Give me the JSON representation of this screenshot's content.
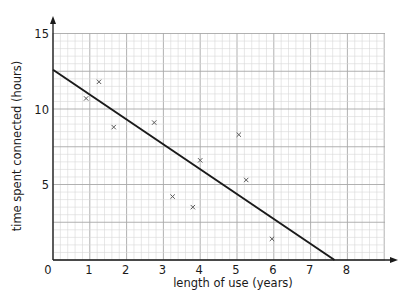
{
  "chart_data": {
    "type": "scatter",
    "title": "",
    "xlabel": "length of use (years)",
    "ylabel": "time spent connected (hours)",
    "xlim": [
      0,
      9
    ],
    "ylim": [
      0,
      15
    ],
    "x_ticks": [
      0,
      1,
      2,
      3,
      4,
      5,
      6,
      7,
      8
    ],
    "y_ticks": [
      5,
      10,
      15
    ],
    "x_tick_labels": [
      "0",
      "1",
      "2",
      "3",
      "4",
      "5",
      "6",
      "7",
      "8"
    ],
    "y_tick_labels": [
      "5",
      "10",
      "15"
    ],
    "grid": true,
    "grid_minor_step": {
      "x": 0.2,
      "y": 0.5
    },
    "grid_major_step": {
      "x": 1,
      "y": 2.5
    },
    "marker": "x",
    "series": [
      {
        "name": "data points",
        "points": [
          {
            "x": 0.9,
            "y": 10.7
          },
          {
            "x": 1.25,
            "y": 11.8
          },
          {
            "x": 1.65,
            "y": 8.8
          },
          {
            "x": 2.75,
            "y": 9.1
          },
          {
            "x": 3.25,
            "y": 4.2
          },
          {
            "x": 3.8,
            "y": 3.5
          },
          {
            "x": 4.0,
            "y": 6.6
          },
          {
            "x": 5.05,
            "y": 8.3
          },
          {
            "x": 5.25,
            "y": 5.3
          },
          {
            "x": 5.95,
            "y": 1.4
          }
        ]
      }
    ],
    "line_of_best_fit": {
      "start": {
        "x": 0,
        "y": 12.6
      },
      "end": {
        "x": 7.65,
        "y": 0
      }
    },
    "legend": null
  },
  "colors": {
    "axis": "#1a1a1a",
    "grid_minor": "#d6d6d6",
    "grid_major": "#a8a8a8",
    "marker": "#5a5a5a",
    "fit_line": "#1a1a1a"
  }
}
